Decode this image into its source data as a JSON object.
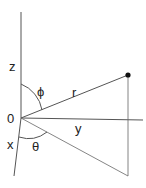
{
  "diagram": {
    "type": "spherical-coordinates",
    "labels": {
      "z_axis": "z",
      "phi": "ϕ",
      "r": "r",
      "origin": "0",
      "y_axis": "y",
      "x_axis": "x",
      "theta": "θ"
    },
    "colors": {
      "line": "#555555",
      "point": "#111111",
      "text": "#222222",
      "background": "#ffffff"
    }
  }
}
